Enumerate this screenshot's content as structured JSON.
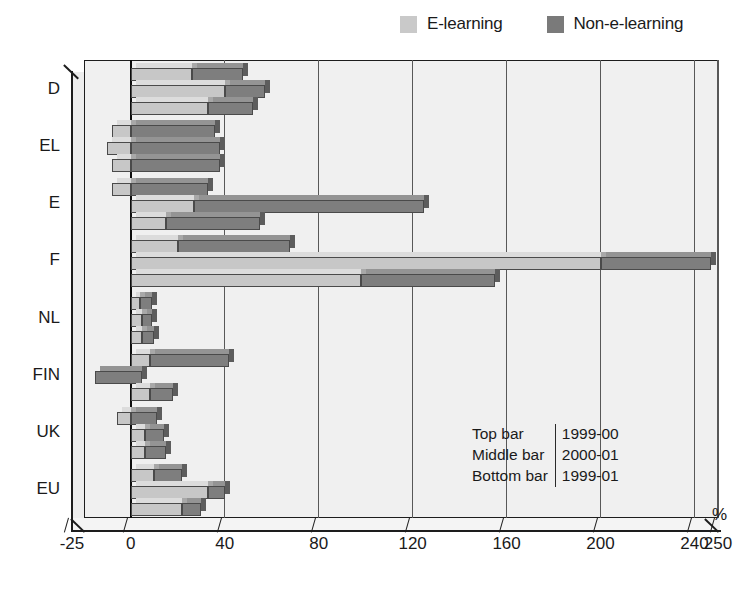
{
  "legend": {
    "items": [
      {
        "label": "E-learning",
        "color": "#c9c9c9",
        "key": "e_learning"
      },
      {
        "label": "Non-e-learning",
        "color": "#7a7a7a",
        "key": "non_e_learning"
      }
    ]
  },
  "note": {
    "rows": [
      {
        "position": "Top bar",
        "period": "1999-00"
      },
      {
        "position": "Middle bar",
        "period": "2000-01"
      },
      {
        "position": "Bottom bar",
        "period": "1999-01"
      }
    ]
  },
  "axis": {
    "x_unit": "%",
    "x_ticks": [
      "-25",
      "0",
      "40",
      "80",
      "120",
      "160",
      "200",
      "240",
      "250"
    ],
    "x_tick_values": [
      -25,
      0,
      40,
      80,
      120,
      160,
      200,
      240,
      250
    ],
    "y_categories": [
      "D",
      "EL",
      "E",
      "F",
      "NL",
      "FIN",
      "UK",
      "EU"
    ]
  },
  "chart_data": {
    "type": "bar",
    "orientation": "horizontal",
    "stacked": true,
    "title": "",
    "xlabel": "%",
    "ylabel": "",
    "xlim": [
      -25,
      250
    ],
    "grid": true,
    "legend_position": "top-right",
    "categories": [
      "D",
      "EL",
      "E",
      "F",
      "NL",
      "FIN",
      "UK",
      "EU"
    ],
    "bar_groups": [
      {
        "label": "Top bar",
        "period": "1999-00"
      },
      {
        "label": "Middle bar",
        "period": "2000-01"
      },
      {
        "label": "Bottom bar",
        "period": "1999-01"
      }
    ],
    "series": [
      {
        "name": "E-learning",
        "color": "#c7c7c7",
        "values": {
          "D": [
            26,
            40,
            33
          ],
          "EL": [
            -8,
            -10,
            -8
          ],
          "E": [
            -8,
            27,
            15
          ],
          "F": [
            20,
            200,
            98
          ],
          "NL": [
            4,
            5,
            5
          ],
          "FIN": [
            8,
            5,
            8
          ],
          "UK": [
            -6,
            6,
            6
          ],
          "EU": [
            10,
            33,
            22
          ]
        }
      },
      {
        "name": "Non-e-learning",
        "color": "#7e7e7e",
        "values": {
          "D": [
            22,
            17,
            19
          ],
          "EL": [
            36,
            38,
            38
          ],
          "E": [
            33,
            98,
            40
          ],
          "F": [
            48,
            47,
            57
          ],
          "NL": [
            5,
            4,
            5
          ],
          "FIN": [
            34,
            -20,
            10
          ],
          "UK": [
            11,
            8,
            9
          ],
          "EU": [
            12,
            7,
            8
          ]
        }
      }
    ],
    "totals": {
      "D": [
        48,
        57,
        52
      ],
      "EL": [
        28,
        28,
        30
      ],
      "E": [
        25,
        125,
        55
      ],
      "F": [
        68,
        247,
        155
      ],
      "NL": [
        9,
        9,
        10
      ],
      "FIN": [
        42,
        -15,
        18
      ],
      "UK": [
        5,
        14,
        15
      ],
      "EU": [
        22,
        40,
        30
      ]
    }
  }
}
